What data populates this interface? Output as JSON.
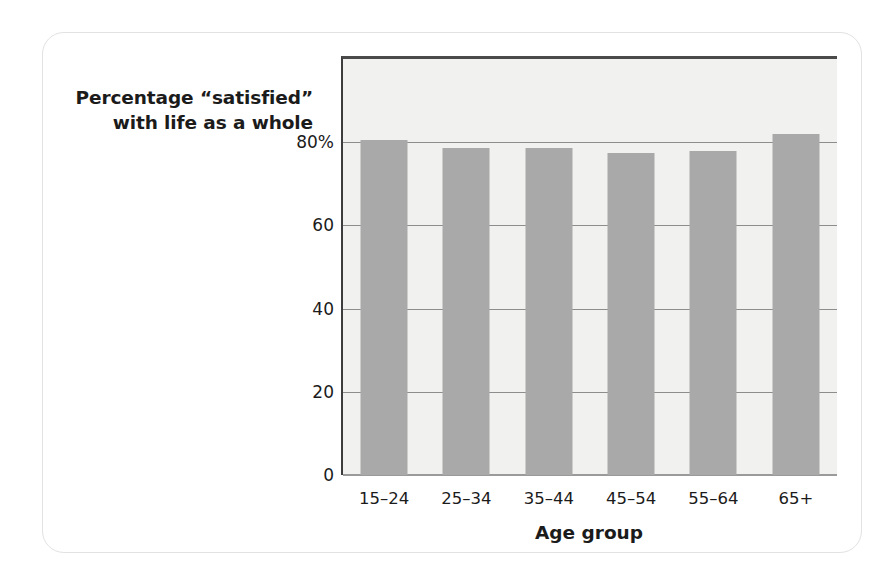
{
  "chart_data": {
    "type": "bar",
    "title": "",
    "xlabel": "Age group",
    "ylabel": "Percentage “satisfied” with life as a whole",
    "ylabel_lines": [
      "Percentage “satisfied”",
      "with life as a whole"
    ],
    "categories": [
      "15–24",
      "25–34",
      "35–44",
      "45–54",
      "55–64",
      "65+"
    ],
    "values": [
      80.5,
      78.5,
      78.5,
      77.5,
      78,
      82
    ],
    "ylim": [
      0,
      100
    ],
    "yticks": [
      0,
      20,
      40,
      60,
      80
    ],
    "ytick_labels": [
      "0",
      "20",
      "40",
      "60",
      "80%"
    ],
    "grid": true,
    "legend": false,
    "bar_color": "#a9a9a9",
    "plot_background": "#f1f1ef",
    "axis_color": "#3d3d3d",
    "gridline_color": "#8d8d8d",
    "card_border_color": "#e2e2e2",
    "text_color": "#1b1b1b"
  }
}
